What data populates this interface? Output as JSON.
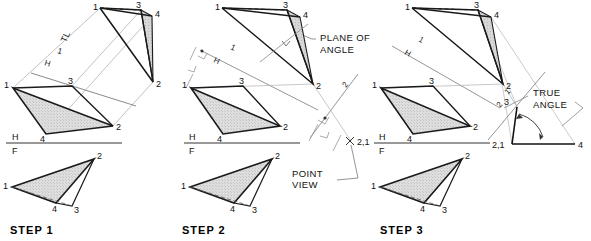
{
  "figure": {
    "background": "#ffffff",
    "ink": "#111111",
    "construction_line_color": "#9a9a9a",
    "fill_gray": "#d9d9d9",
    "fill_gray_dark": "#c9c9c9"
  },
  "steps": [
    {
      "id": "step1",
      "label": "STEP 1",
      "label_x": 10,
      "label_y": 232,
      "origin_x": 0,
      "fold_lines": [
        {
          "name": "hf",
          "upper": "H",
          "lower": "F",
          "x": 10,
          "y": 137
        },
        {
          "name": "1h",
          "upper": "1",
          "lower": "H",
          "x": 52,
          "y": 57,
          "rotated": true
        }
      ],
      "annotations": [
        {
          "name": "true-length-label",
          "text": "TL",
          "x": 66,
          "y": 43,
          "rotated": true
        }
      ],
      "views": {
        "auxiliary": {
          "points": {
            "1": [
              100,
              8
            ],
            "2": [
              153,
              82
            ],
            "3": [
              141,
              10
            ],
            "4": [
              152,
              16
            ]
          }
        },
        "top": {
          "points": {
            "1": [
              13,
              88
            ],
            "2": [
              113,
              126
            ],
            "3": [
              72,
              86
            ],
            "4": [
              46,
              134
            ]
          }
        },
        "front": {
          "points": {
            "1": [
              12,
              187
            ],
            "2": [
              94,
              159
            ],
            "3": [
              72,
              206
            ],
            "4": [
              56,
              203
            ]
          }
        }
      }
    },
    {
      "id": "step2",
      "label": "STEP 2",
      "label_x": 182,
      "label_y": 232,
      "origin_x": 180,
      "fold_lines": [
        {
          "name": "hf",
          "upper": "H",
          "lower": "F",
          "x": 188,
          "y": 137
        },
        {
          "name": "1h",
          "upper": "1",
          "lower": "H",
          "x": 217,
          "y": 58,
          "rotated": true
        },
        {
          "name": "2-1",
          "upper": "2",
          "lower": "1",
          "x": 333,
          "y": 100,
          "rotated": true
        }
      ],
      "annotations": [
        {
          "name": "plane-of-angle-label",
          "line1": "PLANE OF",
          "line2": "ANGLE",
          "x": 320,
          "y": 40
        },
        {
          "name": "point-view-label",
          "line1": "POINT",
          "line2": "VIEW",
          "x": 292,
          "y": 174
        },
        {
          "name": "point-view-marker",
          "text": "2,1",
          "x": 351,
          "y": 143
        }
      ],
      "views": {
        "auxiliary": {
          "points": {
            "1": [
              222,
              8
            ],
            "2": [
              313,
              84
            ],
            "3": [
              287,
              10
            ],
            "4": [
              300,
              17
            ]
          }
        },
        "top": {
          "points": {
            "1": [
              191,
              88
            ],
            "2": [
              280,
              126
            ],
            "3": [
              243,
              86
            ],
            "4": [
              223,
              134
            ]
          }
        },
        "front": {
          "points": {
            "1": [
              190,
              187
            ],
            "2": [
              272,
              159
            ],
            "3": [
              250,
              206
            ],
            "4": [
              234,
              203
            ]
          }
        }
      }
    },
    {
      "id": "step3",
      "label": "STEP 3",
      "label_x": 380,
      "label_y": 232,
      "origin_x": 372,
      "fold_lines": [
        {
          "name": "hf",
          "upper": "H",
          "lower": "F",
          "x": 380,
          "y": 137
        },
        {
          "name": "1h",
          "upper": "1",
          "lower": "H",
          "x": 412,
          "y": 48,
          "rotated": true
        },
        {
          "name": "2-1",
          "upper": "1",
          "lower": "2",
          "x": 523,
          "y": 98,
          "rotated": true
        }
      ],
      "annotations": [
        {
          "name": "true-angle-label",
          "line1": "TRUE",
          "line2": "ANGLE",
          "x": 533,
          "y": 97
        },
        {
          "name": "true-angle-vertex",
          "text": "2,1",
          "x": 500,
          "y": 146
        }
      ],
      "views": {
        "auxiliary": {
          "points": {
            "1": [
              412,
              8
            ],
            "2": [
              503,
              84
            ],
            "3": [
              478,
              10
            ],
            "4": [
              491,
              17
            ]
          }
        },
        "top": {
          "points": {
            "1": [
              381,
              88
            ],
            "2": [
              470,
              126
            ],
            "3": [
              433,
              86
            ],
            "4": [
              413,
              134
            ]
          }
        },
        "front": {
          "points": {
            "1": [
              380,
              187
            ],
            "2": [
              462,
              159
            ],
            "3": [
              440,
              206
            ],
            "4": [
              424,
              203
            ]
          }
        },
        "true_angle": {
          "vertex": [
            512,
            144
          ],
          "ray_a_end": [
            575,
            144
          ],
          "ray_b_end": [
            517,
            107
          ],
          "apex_label": "3",
          "end_label": "4",
          "vertex_label": "2,1"
        }
      }
    }
  ],
  "vertex_labels": [
    "1",
    "2",
    "3",
    "4"
  ],
  "fold_labels": {
    "H": "H",
    "F": "F",
    "one": "1",
    "two": "2"
  },
  "text_labels": {
    "true_length": "TL",
    "plane_of_angle_1": "PLANE OF",
    "plane_of_angle_2": "ANGLE",
    "point_view_1": "POINT",
    "point_view_2": "VIEW",
    "true_angle_1": "TRUE",
    "true_angle_2": "ANGLE",
    "point_view_marker": "2,1",
    "true_angle_vertex": "2,1",
    "step1": "STEP 1",
    "step2": "STEP 2",
    "step3": "STEP 3"
  }
}
